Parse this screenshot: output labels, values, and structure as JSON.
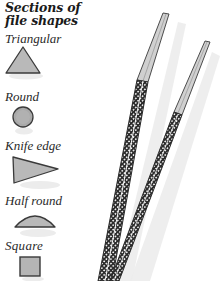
{
  "title": {
    "line1": "Sections of",
    "line2": "file shapes"
  },
  "sections": [
    {
      "label": "Triangular",
      "shape": "triangle-icon"
    },
    {
      "label": "Round",
      "shape": "circle-icon"
    },
    {
      "label": "Knife edge",
      "shape": "knife-edge-icon"
    },
    {
      "label": "Half round",
      "shape": "half-round-icon"
    },
    {
      "label": "Square",
      "shape": "square-icon"
    }
  ],
  "colors": {
    "shape_fill": "#b9b9b9",
    "shape_stroke": "#3a3a3a",
    "shadow": "#e6e6e6",
    "file_fill": "#c8c8c8",
    "file_crosshatch": "#2b2b2b"
  },
  "illustration": {
    "files": [
      {
        "name": "large-file"
      },
      {
        "name": "small-file"
      }
    ]
  }
}
